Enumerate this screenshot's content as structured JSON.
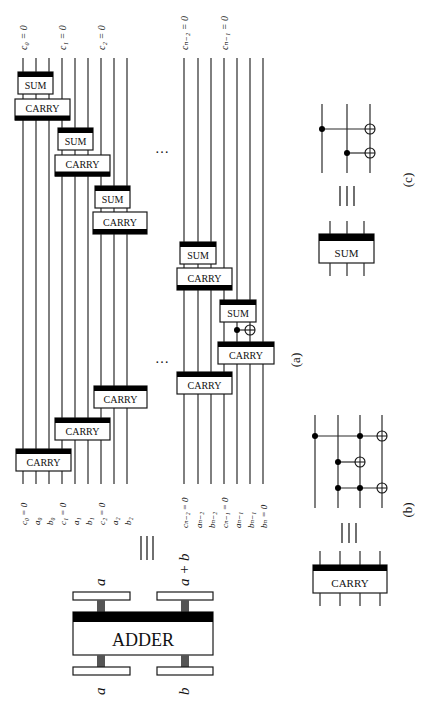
{
  "figure": {
    "orientation": "rotated-90-clockwise",
    "colors": {
      "ink": "#111111",
      "bar": "#000000",
      "post": "#555555",
      "background": "#ffffff"
    },
    "panel_a": {
      "caption": "(a)",
      "top_labels_group1": [
        "c₀ = 0",
        "c₁ = 0",
        "c₂ = 0"
      ],
      "top_labels_group2": [
        "cₙ₋₂ = 0",
        "cₙ₋₁ = 0"
      ],
      "bottom_labels_group1": [
        "c₀ = 0",
        "a₀",
        "b₀",
        "c₁ = 0",
        "a₁",
        "b₁",
        "c₂ = 0",
        "a₂",
        "b₂"
      ],
      "bottom_labels_group2": [
        "cₙ₋₂ = 0",
        "aₙ₋₂",
        "bₙ₋₂",
        "cₙ₋₁ = 0",
        "aₙ₋₁",
        "bₙ₋₁",
        "bₙ = 0"
      ],
      "sum_label": "SUM",
      "carry_label": "CARRY",
      "ellipsis": "…",
      "equiv": "≡"
    },
    "adder": {
      "label": "ADDER",
      "inputs": [
        "a",
        "b"
      ],
      "outputs": [
        "a",
        "a + b"
      ]
    },
    "panel_b": {
      "caption": "(b)",
      "block_label": "CARRY",
      "equiv": "≡"
    },
    "panel_c": {
      "caption": "(c)",
      "block_label": "SUM",
      "equiv": "≡"
    }
  }
}
